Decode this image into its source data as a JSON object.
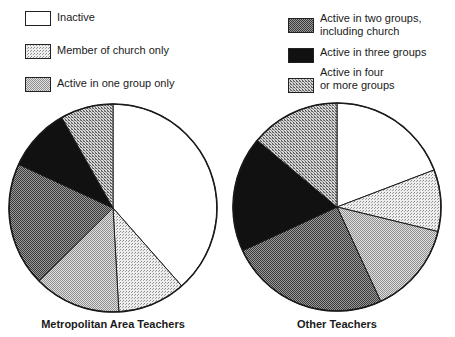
{
  "legend": [
    {
      "key": "inactive",
      "label": "Inactive",
      "fill": "url(#pat-inactive)",
      "x": 25,
      "y": 11,
      "labelY": 0
    },
    {
      "key": "church_only",
      "label": "Member of church only",
      "fill": "url(#pat-church)",
      "x": 25,
      "y": 44,
      "labelY": 0
    },
    {
      "key": "one_group",
      "label": "Active in one group only",
      "fill": "url(#pat-one)",
      "x": 25,
      "y": 77,
      "labelY": 0
    },
    {
      "key": "two_groups",
      "label": "Active in two groups,\nincluding church",
      "fill": "url(#pat-two)",
      "x": 288,
      "y": 18,
      "labelY": -6
    },
    {
      "key": "three_groups",
      "label": "Active in three groups",
      "fill": "#111111",
      "x": 288,
      "y": 48,
      "labelY": -2
    },
    {
      "key": "four_plus",
      "label": "Active in four\nor more groups",
      "fill": "url(#pat-four)",
      "x": 288,
      "y": 78,
      "labelY": -12
    }
  ],
  "chart_data": [
    {
      "type": "pie",
      "title": "Metropolitan Area Teachers",
      "center": [
        113,
        208
      ],
      "radius": 104,
      "start_angle_deg": 0,
      "direction": "clockwise",
      "categories": [
        "Inactive",
        "Member of church only",
        "Active in one group only",
        "Active in two groups, including church",
        "Active in three groups",
        "Active in four or more groups"
      ],
      "values": [
        38.5,
        10.6,
        13.5,
        19.3,
        9.9,
        8.2
      ],
      "unit": "percent (estimated from slice angles)"
    },
    {
      "type": "pie",
      "title": "Other Teachers",
      "center": [
        337,
        207
      ],
      "radius": 104,
      "start_angle_deg": 0,
      "direction": "clockwise",
      "categories": [
        "Inactive",
        "Member of church only",
        "Active in one group only",
        "Active in two groups, including church",
        "Active in three groups",
        "Active in four or more groups"
      ],
      "values": [
        19.2,
        9.6,
        14.3,
        25.0,
        18.0,
        13.9
      ],
      "unit": "percent (estimated from slice angles)"
    }
  ],
  "titles": {
    "left": "Metropolitan Area Teachers",
    "right": "Other Teachers"
  }
}
